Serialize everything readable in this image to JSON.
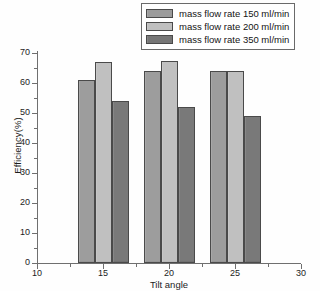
{
  "chart_data": {
    "type": "bar",
    "title": "",
    "xlabel": "Tilt angle",
    "ylabel": "Efficiency(%)",
    "categories": [
      15,
      20,
      25
    ],
    "category_labels": [
      "15",
      "20",
      "25"
    ],
    "series": [
      {
        "name": "mass flow rate 150 ml/min",
        "color": "#9b9b9b",
        "values": [
          61,
          64,
          64
        ]
      },
      {
        "name": "mass flow rate 200 ml/min",
        "color": "#bfbfbf",
        "values": [
          67,
          67.5,
          64
        ]
      },
      {
        "name": "mass flow rate 350 ml/min",
        "color": "#767676",
        "values": [
          54,
          52,
          49
        ]
      }
    ],
    "xlim": [
      10,
      30
    ],
    "ylim": [
      0,
      71
    ],
    "xticks": [
      10,
      15,
      20,
      25,
      30
    ],
    "xtick_labels": [
      "10",
      "15",
      "20",
      "25",
      "30"
    ],
    "yticks": [
      0,
      10,
      20,
      30,
      40,
      50,
      60,
      70
    ],
    "ytick_labels": [
      "0",
      "10",
      "20",
      "30",
      "40",
      "50",
      "60",
      "70"
    ],
    "grid": false,
    "legend_position": "top-right"
  },
  "legend": {
    "entries": [
      {
        "label": "mass flow rate 150 ml/min"
      },
      {
        "label": "mass flow rate 200 ml/min"
      },
      {
        "label": "mass flow rate 350 ml/min"
      }
    ]
  },
  "axes": {
    "y_title": "Efficiency(%)",
    "x_title": "Tilt angle"
  }
}
